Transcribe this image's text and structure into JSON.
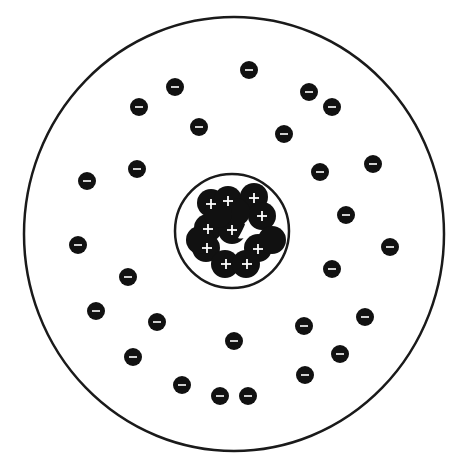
{
  "diagram": {
    "colors": {
      "background": "#ffffff",
      "stroke": "#1a1a1a",
      "particle_fill": "#111111",
      "sign": "#ffffff"
    },
    "atom_boundary": {
      "cx": 234,
      "cy": 234,
      "rx": 210,
      "ry": 217,
      "stroke_width": 2.5
    },
    "nucleus_boundary": {
      "cx": 232,
      "cy": 231,
      "r": 57,
      "stroke_width": 2.5
    },
    "proton_radius": 14,
    "electron_radius": 9,
    "proton_symbol": "+",
    "electron_symbol": "−",
    "protons": [
      {
        "x": 211,
        "y": 203
      },
      {
        "x": 228,
        "y": 200
      },
      {
        "x": 254,
        "y": 197
      },
      {
        "x": 262,
        "y": 216
      },
      {
        "x": 208,
        "y": 228
      },
      {
        "x": 232,
        "y": 230
      },
      {
        "x": 206,
        "y": 248
      },
      {
        "x": 258,
        "y": 248
      },
      {
        "x": 225,
        "y": 264
      },
      {
        "x": 246,
        "y": 264
      },
      {
        "x": 200,
        "y": 240
      },
      {
        "x": 272,
        "y": 240
      },
      {
        "x": 236,
        "y": 212
      },
      {
        "x": 218,
        "y": 214
      }
    ],
    "protons_visible_plus": [
      {
        "x": 211,
        "y": 204
      },
      {
        "x": 228,
        "y": 201
      },
      {
        "x": 254,
        "y": 198
      },
      {
        "x": 262,
        "y": 216
      },
      {
        "x": 208,
        "y": 229
      },
      {
        "x": 232,
        "y": 230
      },
      {
        "x": 207,
        "y": 248
      },
      {
        "x": 258,
        "y": 249
      },
      {
        "x": 226,
        "y": 264
      },
      {
        "x": 247,
        "y": 264
      }
    ],
    "electrons": [
      {
        "x": 175,
        "y": 87
      },
      {
        "x": 249,
        "y": 70
      },
      {
        "x": 139,
        "y": 107
      },
      {
        "x": 309,
        "y": 92
      },
      {
        "x": 332,
        "y": 107
      },
      {
        "x": 199,
        "y": 127
      },
      {
        "x": 284,
        "y": 134
      },
      {
        "x": 87,
        "y": 181
      },
      {
        "x": 137,
        "y": 169
      },
      {
        "x": 320,
        "y": 172
      },
      {
        "x": 373,
        "y": 164
      },
      {
        "x": 346,
        "y": 215
      },
      {
        "x": 78,
        "y": 245
      },
      {
        "x": 390,
        "y": 247
      },
      {
        "x": 128,
        "y": 277
      },
      {
        "x": 332,
        "y": 269
      },
      {
        "x": 96,
        "y": 311
      },
      {
        "x": 157,
        "y": 322
      },
      {
        "x": 365,
        "y": 317
      },
      {
        "x": 234,
        "y": 341
      },
      {
        "x": 304,
        "y": 326
      },
      {
        "x": 340,
        "y": 354
      },
      {
        "x": 133,
        "y": 357
      },
      {
        "x": 182,
        "y": 385
      },
      {
        "x": 305,
        "y": 375
      },
      {
        "x": 220,
        "y": 396
      },
      {
        "x": 248,
        "y": 396
      }
    ],
    "counts": {
      "electrons": 27,
      "visible_proton_signs": 10
    }
  }
}
